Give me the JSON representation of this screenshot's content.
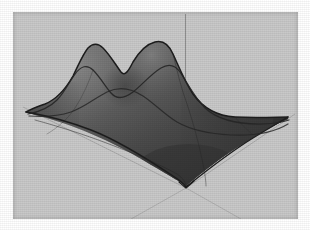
{
  "figure": {
    "kind": "3d-surface-plot",
    "width": 310,
    "height": 230,
    "caption": "",
    "page_background": "#ffffff",
    "plot_background": "#c9c9c9",
    "plot_frame": {
      "x": 13,
      "y": 12,
      "width": 285,
      "height": 207
    }
  },
  "colors": {
    "background": "#c9c9c9",
    "surface_light": "#7a7a7a",
    "surface_mid": "#5a5a5a",
    "surface_dark": "#3a3a3a",
    "surface_darkest": "#2c2c2c",
    "silhouette_stroke": "#1d1d1d",
    "mesh_line": "#262626",
    "axis_line": "#8e8e8e",
    "axis_line_faint": "#a8a8a8"
  },
  "chart_data": {
    "type": "surface",
    "title": "",
    "subtitle": "",
    "xlabel": "",
    "ylabel": "",
    "zlabel": "",
    "grid": false,
    "legend": false,
    "legend_position": "none",
    "colormap": "grayscale",
    "shading": "smooth",
    "axes_shown": [
      "z-axis vertical line",
      "ground axis toward lower-left",
      "ground axis toward lower-right"
    ],
    "tick_labels": {
      "x": [],
      "y": [],
      "z": []
    },
    "axis_ranges": {
      "x": [
        -3,
        3
      ],
      "y": [
        -3,
        3
      ],
      "z": [
        0,
        1
      ]
    },
    "projection": {
      "type": "orthographic",
      "origin_px": [
        186,
        186
      ],
      "left_vertex_px": [
        26,
        112
      ],
      "right_vertex_px": [
        288,
        117
      ],
      "back_vertex_px": [
        150,
        58
      ]
    },
    "features": [
      {
        "name": "left-peak",
        "screen_px": [
          88,
          47
        ],
        "relative_height": 0.93
      },
      {
        "name": "right-peak",
        "screen_px": [
          168,
          43
        ],
        "relative_height": 1.0
      },
      {
        "name": "saddle",
        "screen_px": [
          128,
          68
        ],
        "relative_height": 0.62
      },
      {
        "name": "front-ridge",
        "screen_px": [
          150,
          112
        ],
        "relative_height": 0.4
      },
      {
        "name": "front-corner-minimum",
        "screen_px": [
          186,
          186
        ],
        "relative_height": 0.0
      }
    ],
    "grid_resolution": {
      "u": 24,
      "v": 24
    },
    "x": [
      -3.0,
      -2.5,
      -2.0,
      -1.5,
      -1.0,
      -0.5,
      0.0,
      0.5,
      1.0,
      1.5,
      2.0,
      2.5,
      3.0
    ],
    "y": [
      -3.0,
      -2.5,
      -2.0,
      -1.5,
      -1.0,
      -0.5,
      0.0,
      0.5,
      1.0,
      1.5,
      2.0,
      2.5,
      3.0
    ],
    "z": [
      [
        0.0,
        0.01,
        0.02,
        0.04,
        0.06,
        0.07,
        0.08,
        0.07,
        0.06,
        0.04,
        0.02,
        0.01,
        0.0
      ],
      [
        0.01,
        0.03,
        0.07,
        0.12,
        0.17,
        0.21,
        0.22,
        0.21,
        0.17,
        0.12,
        0.07,
        0.03,
        0.01
      ],
      [
        0.02,
        0.07,
        0.15,
        0.26,
        0.37,
        0.44,
        0.47,
        0.44,
        0.37,
        0.26,
        0.15,
        0.07,
        0.02
      ],
      [
        0.04,
        0.12,
        0.26,
        0.44,
        0.62,
        0.74,
        0.78,
        0.74,
        0.62,
        0.44,
        0.26,
        0.12,
        0.04
      ],
      [
        0.06,
        0.17,
        0.37,
        0.62,
        0.85,
        0.97,
        0.99,
        0.97,
        0.85,
        0.62,
        0.37,
        0.17,
        0.06
      ],
      [
        0.07,
        0.2,
        0.43,
        0.72,
        0.95,
        0.86,
        0.72,
        0.86,
        0.95,
        0.72,
        0.43,
        0.2,
        0.07
      ],
      [
        0.07,
        0.2,
        0.44,
        0.73,
        0.93,
        0.72,
        0.62,
        0.72,
        0.93,
        0.73,
        0.44,
        0.2,
        0.07
      ],
      [
        0.06,
        0.18,
        0.39,
        0.64,
        0.82,
        0.72,
        0.66,
        0.72,
        0.82,
        0.64,
        0.39,
        0.18,
        0.06
      ],
      [
        0.05,
        0.14,
        0.3,
        0.49,
        0.62,
        0.58,
        0.55,
        0.58,
        0.62,
        0.49,
        0.3,
        0.14,
        0.05
      ],
      [
        0.03,
        0.09,
        0.2,
        0.33,
        0.42,
        0.41,
        0.4,
        0.41,
        0.42,
        0.33,
        0.2,
        0.09,
        0.03
      ],
      [
        0.02,
        0.05,
        0.11,
        0.19,
        0.25,
        0.25,
        0.25,
        0.25,
        0.25,
        0.19,
        0.11,
        0.05,
        0.02
      ],
      [
        0.01,
        0.02,
        0.05,
        0.08,
        0.11,
        0.12,
        0.12,
        0.12,
        0.11,
        0.08,
        0.05,
        0.02,
        0.01
      ],
      [
        0.0,
        0.01,
        0.01,
        0.02,
        0.03,
        0.04,
        0.04,
        0.04,
        0.03,
        0.02,
        0.01,
        0.01,
        0.0
      ]
    ]
  }
}
